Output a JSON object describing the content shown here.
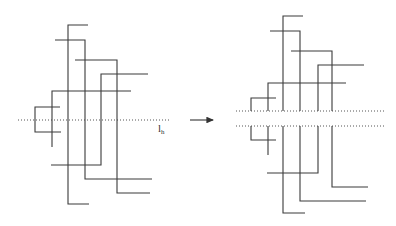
{
  "figure": {
    "line_color": "#3a3a3a",
    "left_panel": {
      "label": {
        "main": "l",
        "sub": "h",
        "x": 158,
        "y": 123
      },
      "dotted_lines": [
        {
          "x1": 18,
          "x2": 170,
          "y": 120
        }
      ],
      "segments": [
        {
          "path": "M88,25 H68 V204 H89"
        },
        {
          "path": "M55,40 H85 V179 H152"
        },
        {
          "path": "M75,60 H117 V193 H150"
        },
        {
          "path": "M148,74 H101 V165 H51"
        },
        {
          "path": "M131,91 H52 V147"
        },
        {
          "path": "M60,107 H35 V132 H61"
        }
      ]
    },
    "arrow": {
      "x1": 190,
      "x2": 213,
      "y": 120,
      "direction": "right"
    },
    "right_panel": {
      "dotted_lines": [
        {
          "x1": 236,
          "x2": 385,
          "y": 111
        },
        {
          "x1": 236,
          "x2": 385,
          "y": 126
        }
      ],
      "segments": [
        {
          "path": "M303,16 H283 V111 M283,126 V213 H305"
        },
        {
          "path": "M270,31 H300 V111 M300,126 V201 H366"
        },
        {
          "path": "M291,51 H332 V111 M332,126 V187 H368"
        },
        {
          "path": "M364,65 H318 V111 M318,126 V173 H267"
        },
        {
          "path": "M346,83 H268 V111 M268,126 V155"
        },
        {
          "path": "M276,98 H251 V111 M251,126 V140 H276"
        }
      ]
    }
  }
}
